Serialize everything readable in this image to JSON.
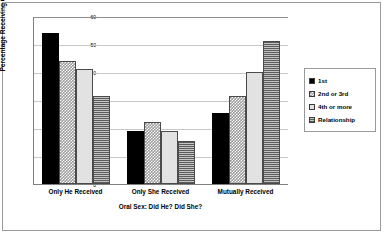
{
  "chart_data": {
    "type": "bar",
    "title": "",
    "xlabel": "Oral Sex: Did He? Did She?",
    "ylabel": "Percentage Receiving Oral Sex",
    "categories": [
      "Only He Received",
      "Only  She Received",
      "Mutually Received"
    ],
    "series": [
      {
        "name": "1st",
        "values": [
          54,
          19,
          25.5
        ]
      },
      {
        "name": "2nd or 3rd",
        "values": [
          44,
          22,
          31.5
        ]
      },
      {
        "name": "4th or more",
        "values": [
          41,
          19,
          40
        ]
      },
      {
        "name": "Relationship",
        "values": [
          31.5,
          15.5,
          51
        ]
      }
    ],
    "ylim": [
      0,
      60
    ],
    "yticks": [
      0,
      10,
      20,
      30,
      40,
      50,
      60
    ],
    "ytick_labels": [
      "0",
      "10",
      "20",
      "30",
      "40",
      "50",
      "60"
    ],
    "grid": true,
    "legend_position": "right",
    "colors": {
      "series_1st": "#000000",
      "series_2nd_or_3rd": "#9a9a9a",
      "series_4th_or_more": "#e2e2e2",
      "series_relationship": "#8e8e8e",
      "gridline": "#c8c8c8",
      "axis": "#808080",
      "frame": "#9a9a9a"
    }
  },
  "legend": {
    "items": [
      {
        "label": "1st"
      },
      {
        "label": "2nd or 3rd"
      },
      {
        "label": "4th or more"
      },
      {
        "label": "Relationship"
      }
    ]
  }
}
